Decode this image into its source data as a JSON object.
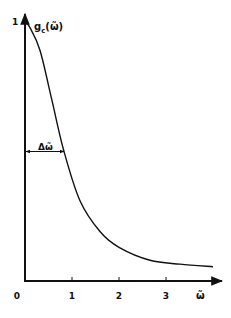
{
  "chart_data": {
    "type": "line",
    "title": "",
    "xlabel": "ω̃",
    "ylabel": "g_c(ω̃)",
    "y_axis_top_label": "1",
    "x_ticks": [
      "0",
      "1",
      "2",
      "3"
    ],
    "xlim": [
      0,
      4.1
    ],
    "ylim": [
      0,
      1
    ],
    "grid": false,
    "legend": null,
    "series": [
      {
        "name": "g_c(ω̃)",
        "x": [
          0,
          0.1,
          0.32,
          0.57,
          0.83,
          1.17,
          1.6,
          2.0,
          2.66,
          3.3,
          4.0
        ],
        "values": [
          1.0,
          0.98,
          0.89,
          0.7,
          0.5,
          0.31,
          0.19,
          0.13,
          0.08,
          0.065,
          0.055
        ]
      }
    ],
    "annotations": [
      {
        "text": "Δω̃",
        "type": "double-arrow",
        "y": 0.5,
        "x_from": 0,
        "x_to": 0.83
      }
    ]
  },
  "labels": {
    "y_top": "1",
    "y_axis_name": "g",
    "y_axis_sub": "c",
    "y_axis_arg": "(ω̃)",
    "x_axis_name": "ω̃",
    "delta": "Δω̃"
  }
}
